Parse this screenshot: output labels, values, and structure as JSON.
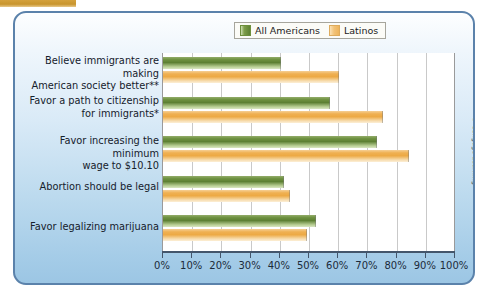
{
  "figure": {
    "credit": "© Cengage Learning",
    "panel_border_color": "#5b82ab",
    "top_tab_color": "#c8952e"
  },
  "legend": {
    "position": "top-center",
    "entries": [
      {
        "label": "All Americans",
        "color": "#5e8233",
        "icon": "legend-swatch-green"
      },
      {
        "label": "Latinos",
        "color": "#eeb45c",
        "icon": "legend-swatch-orange"
      }
    ]
  },
  "axis": {
    "ticks": [
      "0%",
      "10%",
      "20%",
      "30%",
      "40%",
      "50%",
      "60%",
      "70%",
      "80%",
      "90%",
      "100%"
    ]
  },
  "chart_data": {
    "type": "bar",
    "orientation": "horizontal",
    "title": "",
    "subtitle": "",
    "xlabel": "",
    "ylabel": "",
    "xlim": [
      0,
      100
    ],
    "xtick_step": 10,
    "grid": true,
    "legend_position": "top-center",
    "categories": [
      "Believe immigrants are making American society better**",
      "Favor a path to citizenship for immigrants*",
      "Favor increasing the minimum wage to $10.10",
      "Abortion should be legal",
      "Favor legalizing marijuana"
    ],
    "category_lines": [
      [
        "Believe immigrants are making",
        "American society better**"
      ],
      [
        "Favor a path to citizenship",
        "for immigrants*"
      ],
      [
        "Favor increasing the minimum",
        "wage to $10.10"
      ],
      [
        "Abortion should be legal"
      ],
      [
        "Favor legalizing marijuana"
      ]
    ],
    "series": [
      {
        "name": "All Americans",
        "color": "#5e8233",
        "values": [
          40,
          57,
          73,
          41,
          52
        ]
      },
      {
        "name": "Latinos",
        "color": "#eeb45c",
        "values": [
          60,
          75,
          84,
          43,
          49
        ]
      }
    ]
  }
}
